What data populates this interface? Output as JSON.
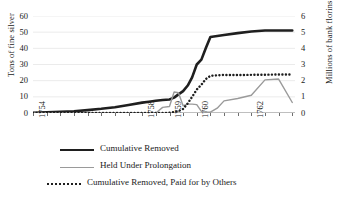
{
  "chart_data": {
    "type": "line",
    "title": "",
    "xlabel": "",
    "ylabel": "Tons of fine silver",
    "ylabel_secondary": "Millions of bank florins",
    "grid": true,
    "grid_axis": "y",
    "legend_position": "bottom",
    "x": [
      1754,
      1754.5,
      1755,
      1755.5,
      1756,
      1756.5,
      1757,
      1757.5,
      1758,
      1758.25,
      1758.5,
      1758.75,
      1759,
      1759.17,
      1759.33,
      1759.5,
      1759.67,
      1759.83,
      1760,
      1760.17,
      1760.33,
      1760.5,
      1760.75,
      1761,
      1761.5,
      1762,
      1762.5,
      1763,
      1763.5
    ],
    "x_axis_ticks": [
      1754,
      1758,
      1759,
      1760,
      1762
    ],
    "x_tick_labels": [
      "1754",
      "1758",
      "1759",
      "1760",
      "1762"
    ],
    "xlim": [
      1754,
      1763.6
    ],
    "ylim": [
      0,
      60
    ],
    "yticks": [
      0,
      10,
      20,
      30,
      40,
      50,
      60
    ],
    "ytick_labels": [
      "0",
      "10",
      "20",
      "30",
      "40",
      "50",
      "60"
    ],
    "ylim_secondary": [
      0,
      6
    ],
    "yticks_secondary": [
      0,
      1,
      2,
      3,
      4,
      5,
      6
    ],
    "ytick_labels_secondary": [
      "0",
      "1",
      "2",
      "3",
      "4",
      "5",
      "6"
    ],
    "series": [
      {
        "name": "Cumulative Removed",
        "axis": "left",
        "style": "solid",
        "color": "#1f1f1f",
        "width": 2.6,
        "values": [
          0.2,
          0.4,
          0.7,
          1.1,
          1.8,
          2.6,
          3.6,
          5.0,
          6.4,
          7.0,
          7.6,
          8.0,
          8.4,
          9.5,
          11.5,
          13.5,
          17.0,
          22.0,
          30.0,
          33.0,
          40.0,
          47.0,
          47.6,
          48.2,
          49.4,
          50.4,
          51.0,
          51.0,
          51.0
        ]
      },
      {
        "name": "Held Under Prolongation",
        "axis": "right",
        "style": "solid",
        "color": "#9a9a9a",
        "width": 1.4,
        "values": [
          0.0,
          0.0,
          0.0,
          0.0,
          0.0,
          0.0,
          0.0,
          0.0,
          0.0,
          0.0,
          0.0,
          0.35,
          0.4,
          1.3,
          1.25,
          0.45,
          0.55,
          0.55,
          0.52,
          0.1,
          0.05,
          0.05,
          0.3,
          0.75,
          0.9,
          1.1,
          2.05,
          2.1,
          0.65
        ]
      },
      {
        "name": "Cumulative Removed, Paid for by Others",
        "axis": "right",
        "style": "dotted",
        "color": "#1f1f1f",
        "width": 2.4,
        "values": [
          0.0,
          0.0,
          0.0,
          0.0,
          0.0,
          0.0,
          0.0,
          0.0,
          0.0,
          0.0,
          0.0,
          0.0,
          0.02,
          0.05,
          0.12,
          0.25,
          0.6,
          1.0,
          1.45,
          1.75,
          2.1,
          2.3,
          2.33,
          2.35,
          2.35,
          2.36,
          2.37,
          2.38,
          2.38
        ]
      }
    ]
  },
  "legend": {
    "items": [
      {
        "label": "Cumulative Removed"
      },
      {
        "label": "Held Under Prolongation"
      },
      {
        "label": "Cumulative Removed, Paid for by Others"
      }
    ]
  }
}
